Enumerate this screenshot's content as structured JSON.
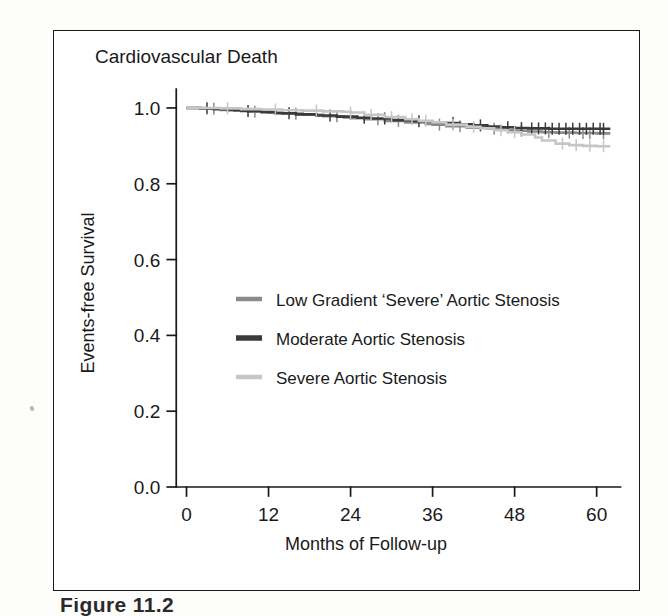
{
  "figure": {
    "caption": "Figure 11.2",
    "frame_color": "#1a1a1a",
    "background": "#ffffff"
  },
  "chart_data": {
    "type": "line",
    "subtype": "kaplan-meier-survival",
    "title": "Cardiovascular Death",
    "xlabel": "Months of Follow-up",
    "ylabel": "Events-free Survival",
    "xlim": [
      -3,
      64
    ],
    "ylim": [
      0.0,
      1.05
    ],
    "xticks": [
      0,
      12,
      24,
      36,
      48,
      60
    ],
    "xtick_labels": [
      "0",
      "12",
      "24",
      "36",
      "48",
      "60"
    ],
    "yticks": [
      0.0,
      0.2,
      0.4,
      0.6,
      0.8,
      1.0
    ],
    "ytick_labels": [
      "0.0",
      "0.2",
      "0.4",
      "0.6",
      "0.8",
      "1.0"
    ],
    "grid": false,
    "legend_position": "center-left",
    "series": [
      {
        "name": "Low Gradient 'Severe' Aortic Stenosis",
        "color": "#8a8a8a",
        "x": [
          0,
          1,
          3,
          5,
          7,
          9,
          12,
          14,
          17,
          20,
          23,
          24,
          26,
          29,
          32,
          35,
          36,
          38,
          41,
          44,
          47,
          48,
          50,
          52,
          54,
          57,
          60,
          62
        ],
        "y": [
          1.0,
          1.0,
          0.998,
          0.995,
          0.993,
          0.99,
          0.988,
          0.985,
          0.982,
          0.978,
          0.975,
          0.973,
          0.97,
          0.966,
          0.962,
          0.958,
          0.956,
          0.952,
          0.948,
          0.945,
          0.942,
          0.94,
          0.938,
          0.936,
          0.935,
          0.934,
          0.933,
          0.933
        ],
        "censor_x": [
          4,
          10,
          16,
          22,
          28,
          31,
          37,
          40,
          45,
          49,
          53,
          56,
          58,
          59,
          61
        ]
      },
      {
        "name": "Moderate Aortic Stenosis",
        "color": "#3a3a3a",
        "x": [
          0,
          2,
          4,
          6,
          8,
          11,
          13,
          16,
          19,
          22,
          25,
          27,
          30,
          33,
          36,
          38,
          40,
          42,
          44,
          46,
          48,
          50,
          53,
          56,
          59,
          62
        ],
        "y": [
          1.0,
          0.999,
          0.997,
          0.995,
          0.992,
          0.989,
          0.986,
          0.983,
          0.98,
          0.977,
          0.974,
          0.972,
          0.968,
          0.965,
          0.962,
          0.96,
          0.957,
          0.954,
          0.951,
          0.949,
          0.947,
          0.946,
          0.945,
          0.945,
          0.945,
          0.945
        ],
        "censor_x": [
          3,
          9,
          15,
          21,
          26,
          29,
          34,
          39,
          43,
          47,
          49,
          50.5,
          51.5,
          52.5,
          53.5,
          54.5,
          55.5,
          56.5,
          57.5,
          58.5,
          59.5,
          60.5,
          61
        ]
      },
      {
        "name": "Severe Aortic Stenosis",
        "color": "#c6c6c6",
        "x": [
          0,
          2,
          5,
          8,
          11,
          14,
          17,
          20,
          23,
          24,
          26,
          29,
          32,
          34,
          36,
          38,
          41,
          43,
          45,
          47,
          49,
          51,
          52,
          54,
          56,
          58,
          60,
          62
        ],
        "y": [
          1.0,
          1.0,
          0.999,
          0.997,
          0.996,
          0.994,
          0.993,
          0.991,
          0.99,
          0.988,
          0.982,
          0.976,
          0.97,
          0.966,
          0.962,
          0.956,
          0.95,
          0.946,
          0.941,
          0.936,
          0.93,
          0.922,
          0.914,
          0.906,
          0.902,
          0.9,
          0.899,
          0.899
        ],
        "censor_x": [
          6,
          13,
          19,
          24,
          27,
          30,
          33,
          35,
          39,
          42,
          46,
          48,
          55,
          57,
          59,
          61
        ]
      }
    ]
  }
}
